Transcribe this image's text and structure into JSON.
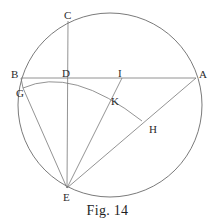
{
  "figure": {
    "caption": "Fig. 14",
    "type": "euclidean-geometry-diagram",
    "stroke_color": "#6b6b6b",
    "background_color": "#ffffff",
    "label_color": "#2b2b2b"
  },
  "points": [
    {
      "id": "A",
      "label": "A",
      "x": 196,
      "y": 78,
      "label_x": 199,
      "label_y": 69
    },
    {
      "id": "B",
      "label": "B",
      "x": 21,
      "y": 78,
      "label_x": 11,
      "label_y": 69
    },
    {
      "id": "C",
      "label": "C",
      "x": 68,
      "y": 21,
      "label_x": 64,
      "label_y": 10
    },
    {
      "id": "D",
      "label": "D",
      "x": 68,
      "y": 78,
      "label_x": 62,
      "label_y": 68
    },
    {
      "id": "E",
      "label": "E",
      "x": 67,
      "y": 188,
      "label_x": 63,
      "label_y": 192
    },
    {
      "id": "G",
      "label": "G",
      "x": 23,
      "y": 88,
      "label_x": 16,
      "label_y": 88
    },
    {
      "id": "H",
      "label": "H",
      "x": 142,
      "y": 121,
      "label_x": 149,
      "label_y": 124
    },
    {
      "id": "I",
      "label": "I",
      "x": 122,
      "y": 78,
      "label_x": 118,
      "label_y": 68
    },
    {
      "id": "K",
      "label": "K",
      "x": 111,
      "y": 93,
      "label_x": 111,
      "label_y": 96
    }
  ],
  "circle": {
    "name": "main-circle",
    "center_x": 110,
    "center_y": 105,
    "radius": 92
  },
  "arc": {
    "name": "arc-G-K-H",
    "center_point": "E",
    "from": "G",
    "through": "K",
    "to": "H",
    "radius": 111
  },
  "segments": [
    {
      "name": "chord-BA",
      "from": "B",
      "to": "A"
    },
    {
      "name": "line-CE",
      "from": "C",
      "to": "E"
    },
    {
      "name": "line-EA",
      "from": "E",
      "to": "A"
    },
    {
      "name": "line-EI",
      "from": "E",
      "to": "I"
    },
    {
      "name": "line-EG",
      "from": "E",
      "to": "G"
    },
    {
      "name": "line-BG",
      "from": "B",
      "to": "G"
    }
  ]
}
